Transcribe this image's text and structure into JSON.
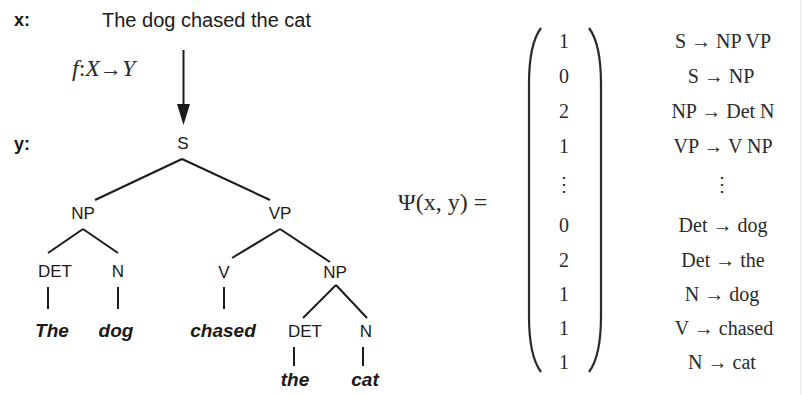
{
  "input": {
    "label": "x:",
    "sentence": "The dog chased the cat"
  },
  "mapping": {
    "f": "f",
    "colon": ":",
    "domain": "X",
    "arrow": "→",
    "codomain": "Y"
  },
  "output": {
    "label": "y:"
  },
  "tree": {
    "root": "S",
    "np_subject": "NP",
    "vp": "VP",
    "det_1": "DET",
    "n_1": "N",
    "v": "V",
    "np_object": "NP",
    "det_2": "DET",
    "n_2": "N",
    "words": {
      "the_cap": "The",
      "dog": "dog",
      "chased": "chased",
      "the": "the",
      "cat": "cat"
    }
  },
  "feature_vector": {
    "lhs": "Ψ(x, y) =",
    "entries": [
      {
        "value": "1",
        "rule": "S → NP VP"
      },
      {
        "value": "0",
        "rule": "S → NP"
      },
      {
        "value": "2",
        "rule": "NP → Det N"
      },
      {
        "value": "1",
        "rule": "VP → V NP"
      },
      {
        "value": "⋮",
        "rule": "⋮"
      },
      {
        "value": "0",
        "rule": "Det → dog"
      },
      {
        "value": "2",
        "rule": "Det → the"
      },
      {
        "value": "1",
        "rule": "N → dog"
      },
      {
        "value": "1",
        "rule": "V → chased"
      },
      {
        "value": "1",
        "rule": "N → cat"
      }
    ]
  },
  "colors": {
    "ink": "#1a1a1a",
    "background": "#ffffff"
  }
}
